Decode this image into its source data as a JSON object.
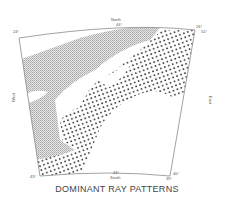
{
  "map": {
    "title": "DOMINANT RAY PATTERNS",
    "directions": {
      "north": "North",
      "south": "South",
      "west": "West",
      "east": "East"
    },
    "corner_labels": {
      "top_left": "24°",
      "top_center": "44°",
      "top_right": "26°",
      "right_top": "51°",
      "bottom_left": "43°",
      "bottom_center": "44°",
      "bottom_right": "40°",
      "bottom_right_lower": "39°"
    },
    "legend_patterns": [
      {
        "name": "fine-stipple-gray",
        "color": "#bdbdbd"
      },
      {
        "name": "coarse-dots",
        "color": "#333333"
      }
    ],
    "colors": {
      "frame": "#8a8a8a",
      "gray_pattern": "#bdbdbd",
      "dots": "#333333",
      "background": "#ffffff"
    }
  }
}
